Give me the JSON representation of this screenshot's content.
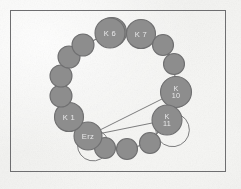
{
  "figure": {
    "title": "",
    "background_color": "#f2f2f0",
    "frame_color": "#6e6e70",
    "node_fill": "#8d8d8d",
    "node_stroke": "#6f6f70",
    "edge_color": "#6f6f70",
    "label_color": "#e9e9ea"
  },
  "diagram": {
    "type": "ring-network",
    "node_count": 16,
    "labelled_nodes": [
      "K 6",
      "K 7",
      "K 10",
      "K 11",
      "K 1",
      "Erz"
    ],
    "nodes": [
      {
        "id": "n0",
        "label": "",
        "cx": 112,
        "cy": 32,
        "r": 14.5,
        "label_lines": []
      },
      {
        "id": "n1",
        "label": "K 7",
        "cx": 141,
        "cy": 34,
        "r": 14.5,
        "label_lines": [
          "K 7"
        ]
      },
      {
        "id": "n2",
        "label": "",
        "cx": 163,
        "cy": 45,
        "r": 10.5,
        "label_lines": []
      },
      {
        "id": "n3",
        "label": "",
        "cx": 174,
        "cy": 64,
        "r": 10.5,
        "label_lines": []
      },
      {
        "id": "n4",
        "label": "K 10",
        "cx": 176,
        "cy": 92,
        "r": 15.5,
        "label_lines": [
          "K",
          "10"
        ]
      },
      {
        "id": "n5",
        "label": "K 11",
        "cx": 167,
        "cy": 120,
        "r": 15.0,
        "label_lines": [
          "K",
          "11"
        ]
      },
      {
        "id": "n6",
        "label": "",
        "cx": 150,
        "cy": 143,
        "r": 10.5,
        "label_lines": []
      },
      {
        "id": "n7",
        "label": "",
        "cx": 127,
        "cy": 149,
        "r": 10.5,
        "label_lines": []
      },
      {
        "id": "n8",
        "label": "",
        "cx": 105,
        "cy": 148,
        "r": 10.5,
        "label_lines": []
      },
      {
        "id": "n9",
        "label": "Erz",
        "cx": 88,
        "cy": 136,
        "r": 14.0,
        "label_lines": [
          "Erz"
        ]
      },
      {
        "id": "n10",
        "label": "K 1",
        "cx": 69,
        "cy": 117,
        "r": 14.5,
        "label_lines": [
          "K 1"
        ]
      },
      {
        "id": "n11",
        "label": "",
        "cx": 61,
        "cy": 96,
        "r": 11.0,
        "label_lines": []
      },
      {
        "id": "n12",
        "label": "",
        "cx": 61,
        "cy": 76,
        "r": 11.0,
        "label_lines": []
      },
      {
        "id": "n13",
        "label": "",
        "cx": 69,
        "cy": 57,
        "r": 11.0,
        "label_lines": []
      },
      {
        "id": "n14",
        "label": "",
        "cx": 83,
        "cy": 45,
        "r": 11.0,
        "label_lines": []
      },
      {
        "id": "n15",
        "label": "K 6",
        "cx": 110,
        "cy": 33,
        "r": 15.0,
        "label_lines": [
          "K 6"
        ]
      }
    ],
    "ring_edges": [
      [
        "n15",
        "n1"
      ],
      [
        "n1",
        "n2"
      ],
      [
        "n2",
        "n3"
      ],
      [
        "n3",
        "n4"
      ],
      [
        "n4",
        "n5"
      ],
      [
        "n5",
        "n6"
      ],
      [
        "n6",
        "n7"
      ],
      [
        "n7",
        "n8"
      ],
      [
        "n8",
        "n9"
      ],
      [
        "n9",
        "n10"
      ],
      [
        "n10",
        "n11"
      ],
      [
        "n11",
        "n12"
      ],
      [
        "n12",
        "n13"
      ],
      [
        "n13",
        "n14"
      ],
      [
        "n14",
        "n15"
      ]
    ],
    "chords": [
      {
        "from": "Erz",
        "to": "K 10"
      },
      {
        "from": "Erz",
        "to": "K 11"
      }
    ],
    "loops": [
      {
        "at": "Erz"
      },
      {
        "at": "K 11"
      }
    ]
  }
}
